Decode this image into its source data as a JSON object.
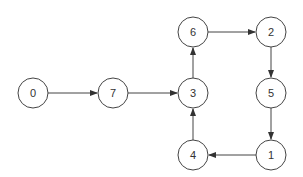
{
  "graph": {
    "type": "directed",
    "node_radius": 15,
    "stroke_color": "#444444",
    "fill_color": "#ffffff",
    "nodes": [
      {
        "id": "0",
        "label": "0",
        "x": 33,
        "y": 93
      },
      {
        "id": "7",
        "label": "7",
        "x": 113,
        "y": 93
      },
      {
        "id": "3",
        "label": "3",
        "x": 193,
        "y": 93
      },
      {
        "id": "6",
        "label": "6",
        "x": 193,
        "y": 32
      },
      {
        "id": "2",
        "label": "2",
        "x": 271,
        "y": 32
      },
      {
        "id": "5",
        "label": "5",
        "x": 271,
        "y": 93
      },
      {
        "id": "1",
        "label": "1",
        "x": 271,
        "y": 155
      },
      {
        "id": "4",
        "label": "4",
        "x": 193,
        "y": 155
      }
    ],
    "edges": [
      {
        "from": "0",
        "to": "7"
      },
      {
        "from": "7",
        "to": "3"
      },
      {
        "from": "3",
        "to": "6"
      },
      {
        "from": "6",
        "to": "2"
      },
      {
        "from": "2",
        "to": "5"
      },
      {
        "from": "5",
        "to": "1"
      },
      {
        "from": "1",
        "to": "4"
      },
      {
        "from": "4",
        "to": "3"
      }
    ]
  }
}
